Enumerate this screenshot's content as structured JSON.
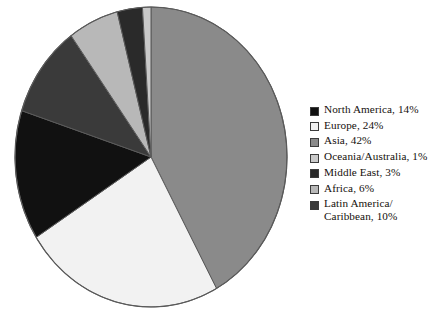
{
  "chart_data": {
    "type": "pie",
    "title": "",
    "subtitle": "",
    "xlabel": "",
    "ylabel": "",
    "units": "percent",
    "total": 100,
    "start_angle_deg": 0,
    "direction": "clockwise",
    "legend_position": "right",
    "grid": false,
    "categories": [
      "North America",
      "Europe",
      "Asia",
      "Oceania/Australia",
      "Middle East",
      "Africa",
      "Latin America/\nCaribbean"
    ],
    "values": [
      14,
      24,
      42,
      1,
      3,
      6,
      10
    ],
    "colors": [
      "#111111",
      "#f2f2f2",
      "#8a8a8a",
      "#c9c9c9",
      "#2a2a2a",
      "#b8b8b8",
      "#3a3a3a"
    ],
    "slice_draw_order": [
      {
        "name": "Asia",
        "value": 42,
        "color": "#8a8a8a"
      },
      {
        "name": "Europe",
        "value": 24,
        "color": "#f2f2f2"
      },
      {
        "name": "North America",
        "value": 14,
        "color": "#111111"
      },
      {
        "name": "Latin America/Caribbean",
        "value": 10,
        "color": "#3a3a3a"
      },
      {
        "name": "Africa",
        "value": 6,
        "color": "#b8b8b8"
      },
      {
        "name": "Middle East",
        "value": 3,
        "color": "#2a2a2a"
      },
      {
        "name": "Oceania/Australia",
        "value": 1,
        "color": "#c9c9c9"
      }
    ]
  },
  "legend": {
    "items": [
      {
        "label": "North America, 14%",
        "color": "#111111"
      },
      {
        "label": "Europe, 24%",
        "color": "#f2f2f2"
      },
      {
        "label": "Asia, 42%",
        "color": "#8a8a8a"
      },
      {
        "label": "Oceania/Australia, 1%",
        "color": "#c9c9c9"
      },
      {
        "label": "Middle East, 3%",
        "color": "#2a2a2a"
      },
      {
        "label": "Africa, 6%",
        "color": "#b8b8b8"
      },
      {
        "label": "Latin America/\nCaribbean, 10%",
        "color": "#3a3a3a"
      }
    ]
  },
  "style": {
    "slice_outline": "#5a5a5a",
    "background": "#ffffff",
    "text_color": "#15100c"
  }
}
